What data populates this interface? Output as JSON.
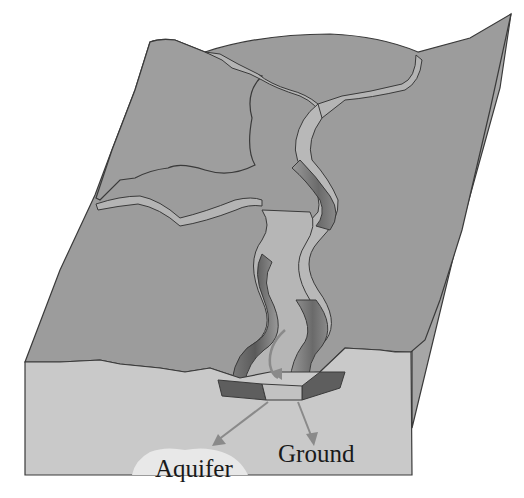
{
  "diagram": {
    "labels": {
      "aquifer": "Aquifer",
      "ground": "Ground"
    },
    "colors": {
      "surface": "#9c9c9c",
      "surface_light": "#a8a8a8",
      "side_face": "#a4a4a4",
      "front_face": "#c9c9c9",
      "channel_bed": "#b5b5b5",
      "bank_dark": "#6e6e6e",
      "stream_section_dark": "#5e5e5e",
      "arrow": "#8a8a8a",
      "aquifer_blob": "#e6e6e6",
      "outline": "#3a3a3a"
    }
  }
}
